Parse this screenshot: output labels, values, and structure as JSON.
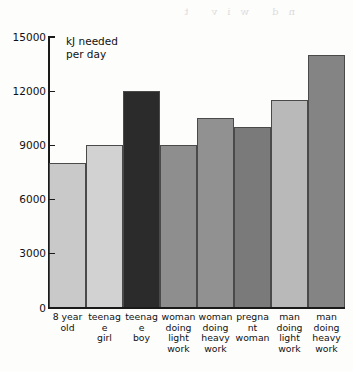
{
  "chart_data": {
    "type": "bar",
    "title": "",
    "annotation": "kJ needed\nper day",
    "xlabel": "",
    "ylabel": "kJ needed per day",
    "ylim": [
      0,
      15000
    ],
    "yticks": [
      0,
      3000,
      6000,
      9000,
      12000,
      15000
    ],
    "ytick_labels": [
      "0",
      "3000",
      "6000",
      "9000",
      "12000",
      "15000"
    ],
    "grid": false,
    "legend": "none",
    "categories": [
      "8 year old",
      "teenage girl",
      "teenage boy",
      "woman doing light work",
      "woman doing heavy work",
      "pregnant woman",
      "man doing light work",
      "man doing heavy work"
    ],
    "category_label_lines": [
      [
        "8 year",
        "old"
      ],
      [
        "teenage",
        "girl"
      ],
      [
        "teenage",
        "boy"
      ],
      [
        "woman",
        "doing",
        "light",
        "work"
      ],
      [
        "woman",
        "doing",
        "heavy",
        "work"
      ],
      [
        "pregnant",
        "woman"
      ],
      [
        "man",
        "doing",
        "light",
        "work"
      ],
      [
        "man",
        "doing",
        "heavy",
        "work"
      ]
    ],
    "values": [
      8000,
      9000,
      12000,
      9000,
      10500,
      10000,
      11500,
      14000
    ],
    "bar_colors": [
      "#c9c9c9",
      "#d2d2d2",
      "#2b2b2b",
      "#8e8e8e",
      "#919191",
      "#7a7a7a",
      "#b9b9b9",
      "#848484"
    ]
  },
  "ghost_text": "nd  wiv  t"
}
